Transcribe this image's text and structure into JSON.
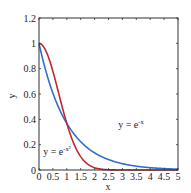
{
  "chart_data": {
    "type": "line",
    "title": "",
    "xlabel": "x",
    "ylabel": "y",
    "xlim": [
      0,
      5
    ],
    "ylim": [
      0,
      1.2
    ],
    "grid": false,
    "xticks": [
      "0",
      "0.5",
      "1",
      "1.5",
      "2",
      "2.5",
      "3",
      "3.5",
      "4",
      "4.5",
      "5"
    ],
    "yticks": [
      "0",
      "0.2",
      "0.4",
      "0.6",
      "0.8",
      "1",
      "1.2"
    ],
    "series": [
      {
        "name": "y = e^-x",
        "color": "#2f6fd0",
        "x": [
          0,
          0.25,
          0.5,
          0.75,
          1,
          1.25,
          1.5,
          1.75,
          2,
          2.5,
          3,
          3.5,
          4,
          4.5,
          5
        ],
        "values": [
          1.0,
          0.779,
          0.607,
          0.472,
          0.368,
          0.287,
          0.223,
          0.174,
          0.135,
          0.082,
          0.05,
          0.03,
          0.018,
          0.011,
          0.007
        ]
      },
      {
        "name": "y = e^-x²",
        "color": "#c0282d",
        "x": [
          0,
          0.25,
          0.5,
          0.75,
          1,
          1.25,
          1.5,
          1.75,
          2,
          2.5,
          3,
          3.5,
          4,
          4.5,
          5
        ],
        "values": [
          1.0,
          0.939,
          0.779,
          0.57,
          0.368,
          0.21,
          0.105,
          0.047,
          0.018,
          0.002,
          0.0,
          0.0,
          0.0,
          0.0,
          0.0
        ]
      }
    ],
    "annotations": [
      {
        "text": "y = e",
        "sup": "-x",
        "x": 2.85,
        "y": 0.33
      },
      {
        "text": "y = e",
        "sup": "-x²",
        "x": 0.15,
        "y": 0.12
      }
    ]
  }
}
